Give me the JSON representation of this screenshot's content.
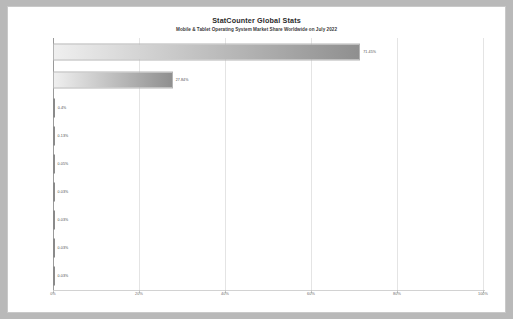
{
  "chart_data": {
    "type": "bar",
    "orientation": "horizontal",
    "title": "StatCounter Global Stats",
    "subtitle": "Mobile & Tablet Operating System Market Share Worldwide on July 2022",
    "xlabel": "",
    "ylabel": "",
    "xlim": [
      0,
      100
    ],
    "grid": true,
    "legend": "none",
    "xticks": [
      "0%",
      "20%",
      "40%",
      "60%",
      "80%",
      "100%"
    ],
    "xtick_values": [
      0,
      20,
      40,
      60,
      80,
      100
    ],
    "categories": [
      "Android",
      "iOS",
      "Samsung",
      "Unknown",
      "KaiOS",
      "Windows",
      "Nokia Unknown",
      "Series 40",
      "Other"
    ],
    "values": [
      71.45,
      27.84,
      0.4,
      0.13,
      0.05,
      0.03,
      0.03,
      0.03,
      0.03
    ],
    "data_labels": [
      "71.45%",
      "27.84%",
      "0.4%",
      "0.13%",
      "0.05%",
      "0.03%",
      "0.03%",
      "0.03%",
      "0.03%"
    ],
    "colors": {
      "bar_gradient_start": "#efefef",
      "bar_gradient_end": "#8f8f8f",
      "grid": "#e4e4e4",
      "axis": "#9a9a9a",
      "text": "#4d4d4d",
      "page_background": "#b9b9b9",
      "plot_background": "#ffffff"
    }
  }
}
